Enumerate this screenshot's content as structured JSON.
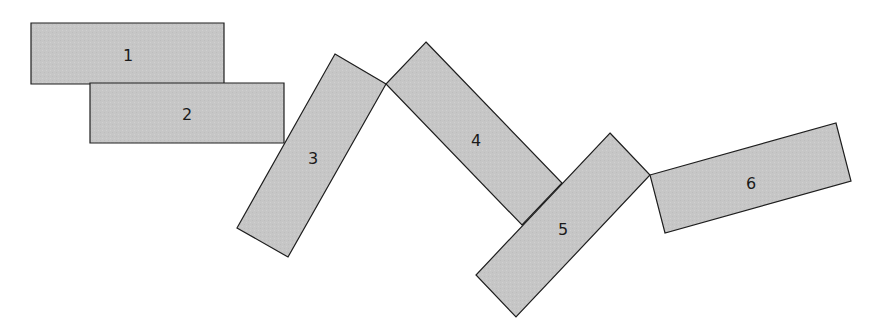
{
  "diagram": {
    "style": {
      "fill": "#c6c6c6",
      "stroke": "#1e1e1e",
      "stroke_width": 1.2,
      "background": "#ffffff"
    },
    "blocks": [
      {
        "label": "1",
        "points": "31,23 224,23 224,84 31,84",
        "label_x": 128,
        "label_y": 55
      },
      {
        "label": "2",
        "points": "90,83 284,83 284,143 90,143",
        "label_x": 187,
        "label_y": 114
      },
      {
        "label": "3",
        "points": "335,54 386,84 288,257 237,228",
        "label_x": 313,
        "label_y": 158
      },
      {
        "label": "4",
        "points": "426,42 562,183 522,225 386,84",
        "label_x": 476,
        "label_y": 140
      },
      {
        "label": "5",
        "points": "610,133 650,175 516,317 476,275",
        "label_x": 563,
        "label_y": 229
      },
      {
        "label": "6",
        "points": "650,175 836,123 851,181 665,233",
        "label_x": 751,
        "label_y": 183
      }
    ]
  }
}
